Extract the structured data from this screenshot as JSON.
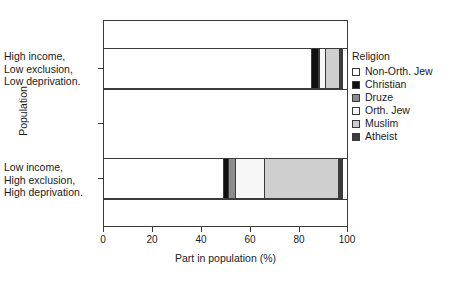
{
  "chart_data": {
    "type": "bar",
    "orientation": "horizontal",
    "stacked": true,
    "title": "",
    "xlabel": "Part in population (%)",
    "ylabel": "Population",
    "xlim": [
      0,
      100
    ],
    "xticks": [
      0,
      20,
      40,
      60,
      80,
      100
    ],
    "xticklabels": [
      "0",
      "20",
      "40",
      "60",
      "80",
      "100"
    ],
    "grid": false,
    "legend_title": "Religion",
    "legend_position": "right",
    "categories": [
      "High income, Low exclusion, Low deprivation.",
      "Low income, High exclusion, High deprivation."
    ],
    "category_lines": [
      [
        "High income,",
        "Low exclusion,",
        "Low deprivation."
      ],
      [
        "Low income,",
        "High exclusion,",
        "High deprivation."
      ]
    ],
    "series": [
      {
        "name": "Non-Orth. Jew",
        "color": "#ffffff",
        "values": [
          85.5,
          49.4
        ]
      },
      {
        "name": "Christian",
        "color": "#101010",
        "values": [
          3.0,
          2.6
        ]
      },
      {
        "name": "Druze",
        "color": "#8c8c8c",
        "values": [
          0.8,
          3.0
        ]
      },
      {
        "name": "Orth. Jew",
        "color": "#f7f7f7",
        "values": [
          3.0,
          12.3
        ]
      },
      {
        "name": "Muslim",
        "color": "#cfcfcf",
        "values": [
          5.9,
          30.7
        ]
      },
      {
        "name": "Atheist",
        "color": "#3d3d3d",
        "values": [
          1.8,
          2.0
        ]
      }
    ]
  },
  "legend": {
    "title": "Religion",
    "items": [
      {
        "label": "Non-Orth. Jew",
        "color": "#ffffff"
      },
      {
        "label": "Christian",
        "color": "#101010"
      },
      {
        "label": "Druze",
        "color": "#8c8c8c"
      },
      {
        "label": "Orth. Jew",
        "color": "#f7f7f7"
      },
      {
        "label": "Muslim",
        "color": "#cfcfcf"
      },
      {
        "label": "Atheist",
        "color": "#3d3d3d"
      }
    ]
  },
  "axes": {
    "x_title": "Part in population (%)",
    "y_title": "Population",
    "x_tick_labels": [
      "0",
      "20",
      "40",
      "60",
      "80",
      "100"
    ]
  },
  "colors": {
    "axis": "#3a3a3a",
    "text": "#1a1a1a",
    "background": "#ffffff"
  }
}
